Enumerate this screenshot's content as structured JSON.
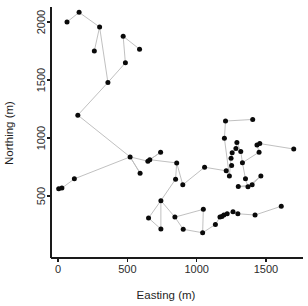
{
  "chart_data": {
    "type": "scatter",
    "title": "",
    "subtitle": "",
    "xlabel": "Easting (m)",
    "ylabel": "Northing (m)",
    "xlim": [
      -60,
      1790
    ],
    "ylim": [
      150,
      2160
    ],
    "xticks": [
      0,
      500,
      1000,
      1500
    ],
    "xticklabels": [
      "0",
      "500",
      "1000",
      "1500"
    ],
    "yticks": [
      500,
      1000,
      1500,
      2000
    ],
    "yticklabels": [
      "500",
      "1000",
      "1500",
      "2000"
    ],
    "grid": false,
    "legend": null,
    "legend_position": "none",
    "marker": "filled-circle",
    "marker_color": "#0a0a0a",
    "edge_color": "#b9b9b9",
    "axis_color": "#1a1a1a",
    "background_color": "#ffffff",
    "points": [
      {
        "id": 0,
        "x": 5,
        "y": 563
      },
      {
        "id": 1,
        "x": 28,
        "y": 568
      },
      {
        "id": 2,
        "x": 118,
        "y": 648
      },
      {
        "id": 3,
        "x": 143,
        "y": 1197
      },
      {
        "id": 4,
        "x": 65,
        "y": 2000
      },
      {
        "id": 5,
        "x": 152,
        "y": 2083
      },
      {
        "id": 6,
        "x": 262,
        "y": 1751
      },
      {
        "id": 7,
        "x": 300,
        "y": 1957
      },
      {
        "id": 8,
        "x": 360,
        "y": 1479
      },
      {
        "id": 9,
        "x": 470,
        "y": 1877
      },
      {
        "id": 10,
        "x": 486,
        "y": 1648
      },
      {
        "id": 11,
        "x": 588,
        "y": 1766
      },
      {
        "id": 12,
        "x": 520,
        "y": 837
      },
      {
        "id": 13,
        "x": 592,
        "y": 697
      },
      {
        "id": 14,
        "x": 648,
        "y": 800
      },
      {
        "id": 15,
        "x": 662,
        "y": 813
      },
      {
        "id": 16,
        "x": 740,
        "y": 877
      },
      {
        "id": 17,
        "x": 653,
        "y": 310
      },
      {
        "id": 18,
        "x": 742,
        "y": 460
      },
      {
        "id": 19,
        "x": 742,
        "y": 215
      },
      {
        "id": 20,
        "x": 843,
        "y": 318
      },
      {
        "id": 21,
        "x": 848,
        "y": 645
      },
      {
        "id": 22,
        "x": 856,
        "y": 785
      },
      {
        "id": 23,
        "x": 900,
        "y": 597
      },
      {
        "id": 24,
        "x": 903,
        "y": 213
      },
      {
        "id": 25,
        "x": 1043,
        "y": 183
      },
      {
        "id": 26,
        "x": 1048,
        "y": 385
      },
      {
        "id": 27,
        "x": 1057,
        "y": 748
      },
      {
        "id": 28,
        "x": 1135,
        "y": 255
      },
      {
        "id": 29,
        "x": 1168,
        "y": 318
      },
      {
        "id": 30,
        "x": 1182,
        "y": 323
      },
      {
        "id": 31,
        "x": 1196,
        "y": 336
      },
      {
        "id": 32,
        "x": 1208,
        "y": 1146
      },
      {
        "id": 33,
        "x": 1200,
        "y": 997
      },
      {
        "id": 34,
        "x": 1213,
        "y": 717
      },
      {
        "id": 35,
        "x": 1220,
        "y": 346
      },
      {
        "id": 36,
        "x": 1236,
        "y": 673
      },
      {
        "id": 37,
        "x": 1248,
        "y": 826
      },
      {
        "id": 38,
        "x": 1252,
        "y": 763
      },
      {
        "id": 39,
        "x": 1256,
        "y": 872
      },
      {
        "id": 40,
        "x": 1262,
        "y": 365
      },
      {
        "id": 41,
        "x": 1283,
        "y": 910
      },
      {
        "id": 42,
        "x": 1290,
        "y": 962
      },
      {
        "id": 43,
        "x": 1297,
        "y": 347
      },
      {
        "id": 44,
        "x": 1300,
        "y": 581
      },
      {
        "id": 45,
        "x": 1318,
        "y": 884
      },
      {
        "id": 46,
        "x": 1330,
        "y": 787
      },
      {
        "id": 47,
        "x": 1352,
        "y": 648
      },
      {
        "id": 48,
        "x": 1370,
        "y": 580
      },
      {
        "id": 49,
        "x": 1404,
        "y": 1160
      },
      {
        "id": 50,
        "x": 1400,
        "y": 597
      },
      {
        "id": 51,
        "x": 1421,
        "y": 336
      },
      {
        "id": 52,
        "x": 1435,
        "y": 940
      },
      {
        "id": 53,
        "x": 1450,
        "y": 878
      },
      {
        "id": 54,
        "x": 1455,
        "y": 952
      },
      {
        "id": 55,
        "x": 1463,
        "y": 673
      },
      {
        "id": 56,
        "x": 1610,
        "y": 412
      },
      {
        "id": 57,
        "x": 1700,
        "y": 905
      }
    ],
    "edges": [
      [
        0,
        1
      ],
      [
        1,
        2
      ],
      [
        2,
        12
      ],
      [
        3,
        12
      ],
      [
        3,
        8
      ],
      [
        4,
        5
      ],
      [
        5,
        7
      ],
      [
        7,
        8
      ],
      [
        6,
        7
      ],
      [
        8,
        10
      ],
      [
        10,
        9
      ],
      [
        9,
        11
      ],
      [
        12,
        13
      ],
      [
        12,
        14
      ],
      [
        14,
        15
      ],
      [
        15,
        16
      ],
      [
        15,
        22
      ],
      [
        22,
        21
      ],
      [
        21,
        18
      ],
      [
        18,
        17
      ],
      [
        18,
        20
      ],
      [
        20,
        24
      ],
      [
        24,
        25
      ],
      [
        22,
        23
      ],
      [
        23,
        27
      ],
      [
        27,
        34
      ],
      [
        34,
        36
      ],
      [
        34,
        38
      ],
      [
        36,
        37
      ],
      [
        37,
        39
      ],
      [
        39,
        41
      ],
      [
        41,
        42
      ],
      [
        42,
        45
      ],
      [
        45,
        46
      ],
      [
        46,
        47
      ],
      [
        47,
        48
      ],
      [
        48,
        44
      ],
      [
        44,
        50
      ],
      [
        50,
        55
      ],
      [
        33,
        32
      ],
      [
        32,
        49
      ],
      [
        33,
        36
      ],
      [
        25,
        28
      ],
      [
        28,
        29
      ],
      [
        29,
        30
      ],
      [
        30,
        31
      ],
      [
        31,
        35
      ],
      [
        35,
        40
      ],
      [
        40,
        43
      ],
      [
        43,
        51
      ],
      [
        51,
        56
      ],
      [
        46,
        53
      ],
      [
        53,
        52
      ],
      [
        52,
        54
      ],
      [
        54,
        57
      ],
      [
        26,
        25
      ],
      [
        26,
        20
      ],
      [
        55,
        48
      ],
      [
        16,
        15
      ],
      [
        19,
        18
      ],
      [
        17,
        19
      ],
      [
        13,
        12
      ]
    ]
  }
}
